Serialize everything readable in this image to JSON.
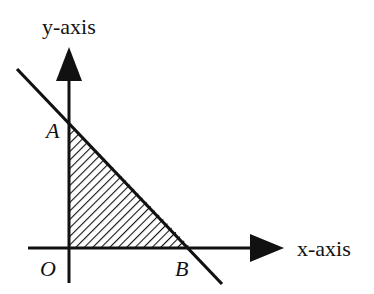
{
  "diagram": {
    "type": "coordinate-region",
    "axes": {
      "x_label": "x-axis",
      "y_label": "y-axis"
    },
    "points": {
      "origin": "O",
      "y_intercept": "A",
      "x_intercept": "B"
    },
    "shaded_region": "triangle OAB",
    "colors": {
      "stroke": "#111111",
      "background": "#ffffff"
    }
  }
}
